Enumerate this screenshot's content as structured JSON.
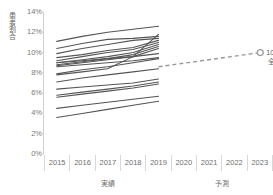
{
  "chart_data": {
    "type": "line",
    "title": "",
    "xlabel": "",
    "ylabel": "患者割合",
    "ylim": [
      0,
      14
    ],
    "ytick_labels": [
      "0%",
      "2%",
      "4%",
      "6%",
      "8%",
      "10%",
      "12%",
      "14%"
    ],
    "ytick_values": [
      0,
      2,
      4,
      6,
      8,
      10,
      12,
      14
    ],
    "categories": [
      "2015",
      "2016",
      "2017",
      "2018",
      "2019",
      "2020",
      "2021",
      "2022",
      "2023"
    ],
    "grid": false,
    "legend_position": "none",
    "x_group_labels": [
      {
        "label": "実績",
        "span": 5
      },
      {
        "label": "予測",
        "span": 4
      }
    ],
    "annotation": {
      "value": "10%",
      "name": "全体",
      "marker": "open-circle",
      "at_category": "2023",
      "at_value": 10.0
    },
    "forecast_series": {
      "name": "全体",
      "style": "dashed",
      "x": [
        "2019",
        "2023"
      ],
      "values": [
        8.6,
        10.0
      ]
    },
    "series": [
      {
        "name": "line-01",
        "x": [
          "2015",
          "2016",
          "2017",
          "2018",
          "2019"
        ],
        "values": [
          11.1,
          11.6,
          12.0,
          12.3,
          12.6
        ]
      },
      {
        "name": "line-02",
        "x": [
          "2015",
          "2016",
          "2017",
          "2018",
          "2019"
        ],
        "values": [
          10.4,
          10.9,
          11.3,
          11.4,
          11.6
        ]
      },
      {
        "name": "line-03",
        "x": [
          "2015",
          "2016",
          "2017",
          "2018",
          "2019"
        ],
        "values": [
          9.9,
          10.4,
          10.8,
          11.2,
          11.4
        ]
      },
      {
        "name": "line-04",
        "x": [
          "2015",
          "2016",
          "2017",
          "2018",
          "2019"
        ],
        "values": [
          9.5,
          9.8,
          10.2,
          10.5,
          11.2
        ]
      },
      {
        "name": "line-05",
        "x": [
          "2015",
          "2016",
          "2017",
          "2018",
          "2019"
        ],
        "values": [
          9.2,
          9.6,
          10.0,
          10.3,
          11.0
        ]
      },
      {
        "name": "line-06",
        "x": [
          "2015",
          "2016",
          "2017",
          "2018",
          "2019"
        ],
        "values": [
          9.0,
          9.3,
          9.6,
          10.0,
          10.8
        ]
      },
      {
        "name": "line-07",
        "x": [
          "2015",
          "2016",
          "2017",
          "2018",
          "2019"
        ],
        "values": [
          8.8,
          9.1,
          9.4,
          9.8,
          10.6
        ]
      },
      {
        "name": "line-08",
        "x": [
          "2015",
          "2016",
          "2017",
          "2018",
          "2019"
        ],
        "values": [
          8.7,
          9.0,
          9.3,
          9.6,
          10.4
        ]
      },
      {
        "name": "line-09",
        "x": [
          "2015",
          "2016",
          "2017",
          "2018",
          "2019"
        ],
        "values": [
          9.0,
          9.2,
          9.4,
          9.6,
          9.9
        ]
      },
      {
        "name": "line-10",
        "x": [
          "2015",
          "2016",
          "2017",
          "2018",
          "2019"
        ],
        "values": [
          8.6,
          8.8,
          9.0,
          9.2,
          9.5
        ]
      },
      {
        "name": "line-11",
        "x": [
          "2015",
          "2016",
          "2017",
          "2018",
          "2019"
        ],
        "values": [
          7.9,
          8.3,
          8.6,
          9.0,
          9.4
        ]
      },
      {
        "name": "line-12",
        "x": [
          "2015",
          "2016",
          "2017",
          "2018",
          "2019"
        ],
        "values": [
          7.1,
          7.5,
          7.8,
          8.1,
          8.4
        ]
      },
      {
        "name": "line-13",
        "x": [
          "2015",
          "2016",
          "2017",
          "2018",
          "2019"
        ],
        "values": [
          6.4,
          6.6,
          6.8,
          7.0,
          7.4
        ]
      },
      {
        "name": "line-14",
        "x": [
          "2015",
          "2016",
          "2017",
          "2018",
          "2019"
        ],
        "values": [
          5.8,
          6.1,
          6.4,
          6.7,
          7.1
        ]
      },
      {
        "name": "line-15",
        "x": [
          "2015",
          "2016",
          "2017",
          "2018",
          "2019"
        ],
        "values": [
          5.6,
          5.9,
          6.2,
          6.5,
          6.9
        ]
      },
      {
        "name": "line-16",
        "x": [
          "2015",
          "2016",
          "2017",
          "2018",
          "2019"
        ],
        "values": [
          4.5,
          4.8,
          5.1,
          5.4,
          5.7
        ]
      },
      {
        "name": "line-17",
        "x": [
          "2015",
          "2016",
          "2017",
          "2018",
          "2019"
        ],
        "values": [
          3.6,
          4.0,
          4.4,
          4.8,
          5.2
        ]
      },
      {
        "name": "line-18",
        "x": [
          "2015",
          "2016",
          "2017",
          "2018",
          "2019"
        ],
        "values": [
          7.8,
          8.1,
          8.4,
          9.6,
          11.8
        ]
      }
    ],
    "colors": {
      "line": "#555555",
      "forecast_line": "#999999",
      "axis": "#d0d0d0",
      "text": "#6b6b6b"
    }
  }
}
